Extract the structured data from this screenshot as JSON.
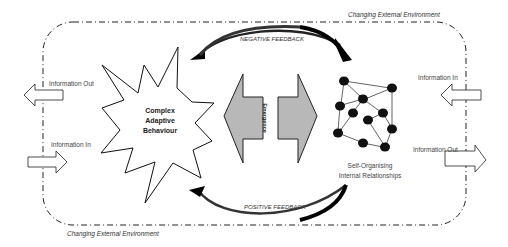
{
  "diagram": {
    "environment_label_top": "Changing External Environment",
    "environment_label_bottom": "Changing External Environment",
    "negative_feedback": "NEGATIVE FEEDBACK",
    "positive_feedback": "POSITIVE FEEDBACK",
    "emergence": "Emergence",
    "complex_adaptive": {
      "line1": "Complex",
      "line2": "Adaptive",
      "line3": "Behaviour"
    },
    "self_organising": {
      "line1": "Self-Organising",
      "line2": "Internal Relationships"
    },
    "left": {
      "info_out": "Information Out",
      "info_in": "Information In"
    },
    "right": {
      "info_in": "Information In",
      "info_out": "Information Out"
    },
    "colors": {
      "border": "#222222",
      "emergence_fill": "#b8b8b8",
      "node": "#111111",
      "feedback_arrow": "#111111"
    }
  }
}
